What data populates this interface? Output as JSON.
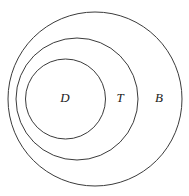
{
  "figure": {
    "background_color": "#ffffff",
    "stroke_color": "#3b3b3b",
    "label_color": "#1a1a1a",
    "width": 189,
    "height": 196
  },
  "chart_data": {
    "type": "diagram",
    "subtype": "euler-venn-nested",
    "title": "",
    "xlabel": "",
    "ylabel": "",
    "grid": false,
    "legend": "none",
    "relation": "D subset of T subset of B",
    "sets": [
      {
        "name": "B",
        "label": "B",
        "level": 0,
        "cx": 95,
        "cy": 99,
        "r": 87,
        "label_x": 159,
        "label_y": 99,
        "fill": "none",
        "stroke": "#3b3b3b"
      },
      {
        "name": "T",
        "label": "T",
        "level": 1,
        "cx": 77,
        "cy": 99,
        "r": 61,
        "label_x": 120,
        "label_y": 99,
        "fill": "none",
        "stroke": "#3b3b3b"
      },
      {
        "name": "D",
        "label": "D",
        "level": 2,
        "cx": 65.5,
        "cy": 99,
        "r": 40,
        "label_x": 65,
        "label_y": 99,
        "fill": "none",
        "stroke": "#3b3b3b"
      }
    ]
  }
}
